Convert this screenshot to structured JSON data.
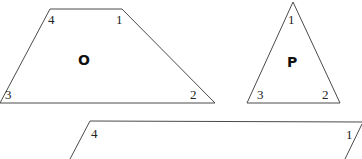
{
  "shapes": {
    "O": {
      "name": "O",
      "type": "trapezoid",
      "vertices": [
        {
          "label": "1",
          "x": 122,
          "y": 9
        },
        {
          "label": "2",
          "x": 215,
          "y": 103
        },
        {
          "label": "3",
          "x": 0,
          "y": 103
        },
        {
          "label": "4",
          "x": 50,
          "y": 9
        }
      ]
    },
    "P": {
      "name": "P",
      "type": "triangle",
      "vertices": [
        {
          "label": "1",
          "x": 293,
          "y": 2
        },
        {
          "label": "2",
          "x": 340,
          "y": 103
        },
        {
          "label": "3",
          "x": 247,
          "y": 103
        }
      ]
    },
    "Q": {
      "type": "parallelogram",
      "partial": true,
      "vertices": [
        {
          "label": "1",
          "x": 362,
          "y": 122
        },
        {
          "label": "4",
          "x": 90,
          "y": 121
        }
      ]
    }
  },
  "colors": {
    "stroke": "#4a4a4a",
    "text": "#222222",
    "background": "#ffffff"
  }
}
